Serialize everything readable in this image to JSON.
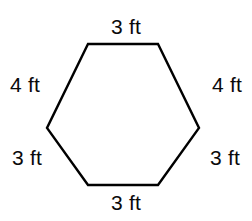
{
  "figure": {
    "type": "geometry-diagram",
    "shape_name": "hexagon",
    "background_color": "#ffffff",
    "stroke_color": "#000000",
    "stroke_width": 2,
    "unit": "ft",
    "labels": {
      "top": "3 ft",
      "upper_left": "4 ft",
      "upper_right": "4 ft",
      "lower_left": "3 ft",
      "lower_right": "3 ft",
      "bottom": "3 ft"
    },
    "side_lengths": [
      3,
      4,
      4,
      3,
      3,
      3
    ],
    "vertices": [
      {
        "name": "top-left",
        "x": 88,
        "y": 44
      },
      {
        "name": "top-right",
        "x": 158,
        "y": 44
      },
      {
        "name": "right",
        "x": 199,
        "y": 128
      },
      {
        "name": "bottom-right",
        "x": 158,
        "y": 185
      },
      {
        "name": "bottom-left",
        "x": 88,
        "y": 185
      },
      {
        "name": "left",
        "x": 47,
        "y": 128
      }
    ],
    "polygon_points": "88,44 158,44 199,128 158,185 88,185 47,128"
  }
}
